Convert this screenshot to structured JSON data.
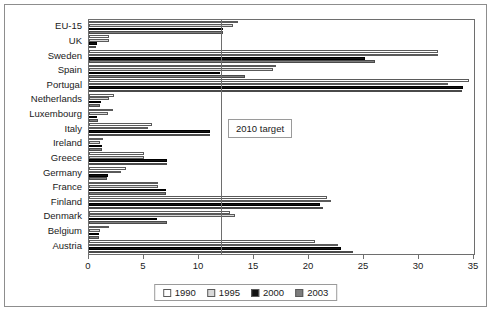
{
  "chart_data": {
    "type": "bar",
    "orientation": "horizontal",
    "title": "",
    "xlabel": "",
    "ylabel": "",
    "xlim": [
      0,
      35
    ],
    "xticks": [
      0,
      5,
      10,
      15,
      20,
      25,
      30,
      35
    ],
    "grid": false,
    "legend_position": "bottom",
    "annotations": [
      {
        "text": "2010 target",
        "value": 12
      }
    ],
    "reference_line": {
      "label": "2010 target",
      "value": 12
    },
    "categories": [
      "EU-15",
      "UK",
      "Sweden",
      "Spain",
      "Portugal",
      "Netherlands",
      "Luxembourg",
      "Italy",
      "Ireland",
      "Greece",
      "Germany",
      "France",
      "Finland",
      "Denmark",
      "Belgium",
      "Austria"
    ],
    "series": [
      {
        "name": "1990",
        "color": "#ffffff",
        "values": [
          13.5,
          1.8,
          31.7,
          17.0,
          34.5,
          2.3,
          2.2,
          5.7,
          1.3,
          5.0,
          3.4,
          6.3,
          21.6,
          12.8,
          1.8,
          20.5
        ]
      },
      {
        "name": "1995",
        "color": "#d9d9d9",
        "values": [
          13.1,
          1.8,
          31.7,
          16.7,
          32.6,
          1.8,
          1.7,
          5.4,
          1.0,
          5.0,
          2.9,
          6.3,
          22.0,
          13.3,
          1.0,
          22.6
        ]
      },
      {
        "name": "2000",
        "color": "#111111",
        "values": [
          12.2,
          0.7,
          25.1,
          11.9,
          34.0,
          1.1,
          0.7,
          11.0,
          1.2,
          7.1,
          1.7,
          7.0,
          21.0,
          6.2,
          0.9,
          22.9
        ]
      },
      {
        "name": "2003",
        "color": "#7d7d7d",
        "values": [
          12.2,
          0.6,
          26.0,
          14.2,
          33.9,
          1.0,
          0.8,
          11.0,
          1.2,
          7.1,
          1.6,
          7.0,
          21.3,
          7.1,
          0.9,
          24.0
        ]
      }
    ]
  },
  "legend": {
    "items": [
      {
        "label": "1990"
      },
      {
        "label": "1995"
      },
      {
        "label": "2000"
      },
      {
        "label": "2003"
      }
    ]
  }
}
